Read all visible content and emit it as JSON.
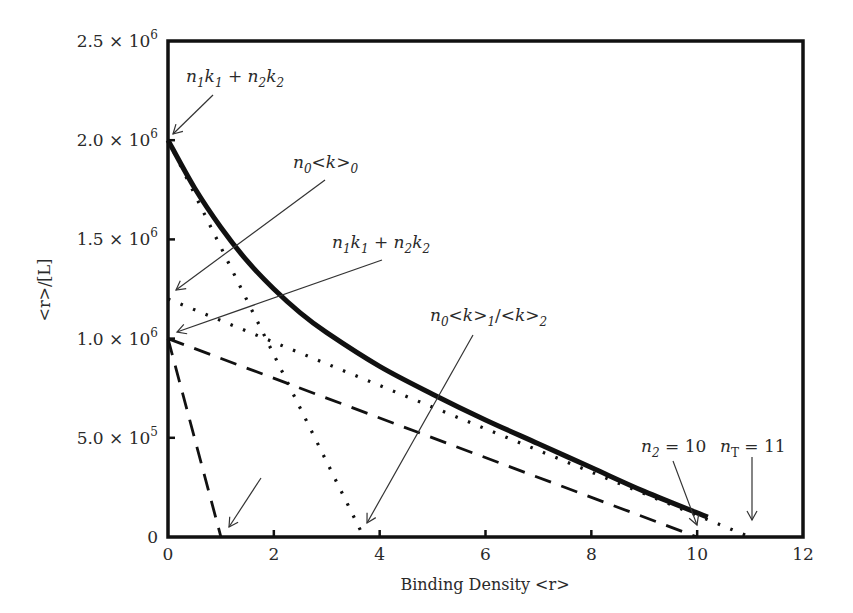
{
  "chart_data": {
    "type": "line",
    "title": "",
    "xlabel": "Binding Density <r>",
    "ylabel": "<r>/[L]",
    "xlim": [
      0,
      12
    ],
    "ylim": [
      0,
      2500000
    ],
    "grid": false,
    "legend": null,
    "x_ticks": [
      0,
      2,
      4,
      6,
      8,
      10,
      12
    ],
    "x_tick_labels": [
      "0",
      "2",
      "4",
      "6",
      "8",
      "10",
      "12"
    ],
    "y_ticks": [
      0,
      500000,
      1000000,
      1500000,
      2000000,
      2500000
    ],
    "y_tick_labels": [
      {
        "mant": "0",
        "exp": ""
      },
      {
        "mant": "5.0 × 10",
        "exp": "5"
      },
      {
        "mant": "1.0 × 10",
        "exp": "6"
      },
      {
        "mant": "1.5 × 10",
        "exp": "6"
      },
      {
        "mant": "2.0 × 10",
        "exp": "6"
      },
      {
        "mant": "2.5 × 10",
        "exp": "6"
      }
    ],
    "series": [
      {
        "name": "total Scatchard curve",
        "style": "solid-thick",
        "x": [
          0,
          0.5,
          1,
          1.5,
          2,
          2.5,
          3,
          4,
          5,
          6,
          7,
          8,
          9,
          10.2
        ],
        "y": [
          2000000,
          1760000,
          1560000,
          1390000,
          1250000,
          1130000,
          1030000,
          860000,
          720000,
          590000,
          470000,
          350000,
          230000,
          100000
        ]
      },
      {
        "name": "class 1 steep (dotted)",
        "style": "dotted",
        "x": [
          0,
          3.7
        ],
        "y": [
          2000000,
          0
        ]
      },
      {
        "name": "class 2 shallow (dotted)",
        "style": "dotted",
        "x": [
          0,
          11
        ],
        "y": [
          1200000,
          0
        ]
      },
      {
        "name": "class 1 steep (dashed)",
        "style": "dashed",
        "x": [
          0,
          1
        ],
        "y": [
          1000000,
          0
        ]
      },
      {
        "name": "class 2 shallow (dashed)",
        "style": "dashed",
        "x": [
          0,
          10
        ],
        "y": [
          1000000,
          0
        ]
      }
    ],
    "annotations": [
      {
        "id": "a1",
        "text_parts": [
          [
            "n",
            "i"
          ],
          [
            "1",
            "sub"
          ],
          [
            "k",
            "i"
          ],
          [
            "1",
            "sub"
          ],
          [
            " + ",
            "n"
          ],
          [
            "n",
            "i"
          ],
          [
            "2",
            "sub"
          ],
          [
            "k",
            "i"
          ],
          [
            "2",
            "sub"
          ]
        ],
        "label_px": [
          186,
          82
        ],
        "from_px": [
          213,
          95
        ],
        "to_px": [
          173,
          134
        ]
      },
      {
        "id": "a2",
        "text_parts": [
          [
            "n",
            "i"
          ],
          [
            "0",
            "sub"
          ],
          [
            "<",
            "n"
          ],
          [
            "k",
            "i"
          ],
          [
            ">",
            "n"
          ],
          [
            "0",
            "sub"
          ]
        ],
        "label_px": [
          293,
          168
        ],
        "from_px": [
          325,
          180
        ],
        "to_px": [
          176,
          290
        ]
      },
      {
        "id": "a3",
        "text_parts": [
          [
            "n",
            "i"
          ],
          [
            "1",
            "sub"
          ],
          [
            "k",
            "i"
          ],
          [
            "1",
            "sub"
          ],
          [
            " + ",
            "n"
          ],
          [
            "n",
            "i"
          ],
          [
            "2",
            "sub"
          ],
          [
            "k",
            "i"
          ],
          [
            "2",
            "sub"
          ]
        ],
        "label_px": [
          332,
          248
        ],
        "from_px": [
          382,
          260
        ],
        "to_px": [
          177,
          332
        ]
      },
      {
        "id": "a4",
        "text_parts": [
          [
            "n",
            "i"
          ],
          [
            "0",
            "sub"
          ],
          [
            "<",
            "n"
          ],
          [
            "k",
            "i"
          ],
          [
            ">",
            "n"
          ],
          [
            "1",
            "sub"
          ],
          [
            "/<",
            "n"
          ],
          [
            "k",
            "i"
          ],
          [
            ">",
            "n"
          ],
          [
            "2",
            "sub"
          ]
        ],
        "label_px": [
          430,
          321
        ],
        "from_px": [
          473,
          335
        ],
        "to_px": [
          367,
          523
        ]
      },
      {
        "id": "a5",
        "text_parts": [],
        "label_px": null,
        "from_px": [
          261,
          478
        ],
        "to_px": [
          229,
          527
        ]
      },
      {
        "id": "a6",
        "text_parts": [
          [
            "n",
            "i"
          ],
          [
            "2",
            "sub"
          ],
          [
            " = 10",
            "n"
          ]
        ],
        "label_px": [
          641,
          452
        ],
        "from_px": [
          673,
          461
        ],
        "to_px": [
          697,
          525
        ]
      },
      {
        "id": "a7",
        "text_parts": [
          [
            "n",
            "i"
          ],
          [
            "T",
            "subup"
          ],
          [
            " = 11",
            "n"
          ]
        ],
        "label_px": [
          720,
          452
        ],
        "from_px": [
          752,
          457
        ],
        "to_px": [
          752,
          520
        ]
      }
    ]
  },
  "layout": {
    "plot_left": 168,
    "plot_right": 803,
    "plot_top": 41,
    "plot_bottom": 537,
    "line_color": "#111111"
  }
}
